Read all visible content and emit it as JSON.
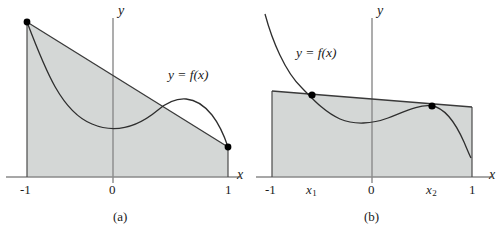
{
  "figure": {
    "type": "math-diagram",
    "background_color": "#ffffff",
    "shade_color": "#d4d7d6",
    "line_color": "#3a3a3a",
    "axis_color": "#8a8a8a",
    "dot_color": "#000000"
  },
  "panels": [
    {
      "id": "a",
      "caption": "(a)",
      "y_axis_label": "y",
      "x_axis_label": "x",
      "function_label": "y = f(x)",
      "x_ticks": [
        {
          "label": "-1",
          "kind": "plain"
        },
        {
          "label": "0",
          "kind": "plain"
        },
        {
          "label": "1",
          "kind": "plain"
        }
      ],
      "description": "Region between a straight chord and the x-axis on [-1, 1]; the curve y = f(x) starts at the left endpoint, dips below the chord, then rises above it before meeting the right endpoint.",
      "marked_points": [
        {
          "name": "left-endpoint",
          "x": -1
        },
        {
          "name": "right-endpoint",
          "x": 1
        }
      ]
    },
    {
      "id": "b",
      "caption": "(b)",
      "y_axis_label": "y",
      "x_axis_label": "x",
      "function_label": "y = f(x)",
      "x_ticks": [
        {
          "label": "-1",
          "kind": "plain"
        },
        {
          "label": "x",
          "sub": "1",
          "kind": "subscript"
        },
        {
          "label": "0",
          "kind": "plain"
        },
        {
          "label": "x",
          "sub": "2",
          "kind": "subscript"
        },
        {
          "label": "1",
          "kind": "plain"
        }
      ],
      "description": "Region under a nearly level chord on [-1, 1]; the curve y = f(x) descends steeply from above, crosses the chord at x1, dips, rises to touch the chord at x2, then falls below it.",
      "marked_points": [
        {
          "name": "intersection-x1",
          "x": "x1"
        },
        {
          "name": "intersection-x2",
          "x": "x2"
        }
      ]
    }
  ]
}
